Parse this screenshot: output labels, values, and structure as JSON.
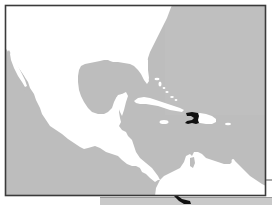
{
  "map": {
    "title": "Caribbean region map with Haiti highlighted",
    "region": "Gulf of Mexico and Caribbean Sea",
    "highlighted_country": "Haiti",
    "colors": {
      "page_background": "#ffffff",
      "water": "#bdbdbd",
      "land": "#ffffff",
      "highlight": "#111111",
      "frame_border": "#3a3a3a",
      "below_frame_panel": "#c8c8c8"
    },
    "features": [
      {
        "name": "United States",
        "type": "land"
      },
      {
        "name": "Mexico",
        "type": "land"
      },
      {
        "name": "Baja California",
        "type": "land"
      },
      {
        "name": "Central America",
        "type": "land"
      },
      {
        "name": "Cuba",
        "type": "land"
      },
      {
        "name": "Jamaica",
        "type": "land"
      },
      {
        "name": "Hispaniola",
        "type": "land"
      },
      {
        "name": "Haiti",
        "type": "highlighted-land"
      },
      {
        "name": "Puerto Rico",
        "type": "land"
      },
      {
        "name": "Bahamas",
        "type": "land"
      },
      {
        "name": "South America (north coast)",
        "type": "land"
      },
      {
        "name": "Gulf of Mexico",
        "type": "water"
      },
      {
        "name": "Caribbean Sea",
        "type": "water"
      },
      {
        "name": "Pacific Ocean",
        "type": "water"
      },
      {
        "name": "Atlantic Ocean",
        "type": "water"
      }
    ]
  }
}
